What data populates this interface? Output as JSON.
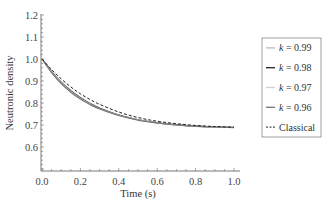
{
  "chart_data": {
    "type": "line",
    "title": "",
    "xlabel": "Time (s)",
    "ylabel": "Neutronic density",
    "xlim": [
      0.0,
      1.0
    ],
    "ylim": [
      0.49,
      1.2
    ],
    "xticks": [
      "0.0",
      "0.2",
      "0.4",
      "0.6",
      "0.8",
      "1.0"
    ],
    "yticks": [
      "0.6",
      "0.7",
      "0.8",
      "0.9",
      "1.0",
      "1.1",
      "1.2"
    ],
    "grid": false,
    "legend_position": "right-outside",
    "x": [
      0.0,
      0.05,
      0.1,
      0.15,
      0.2,
      0.25,
      0.3,
      0.4,
      0.5,
      0.6,
      0.7,
      0.8,
      0.9,
      1.0
    ],
    "series": [
      {
        "name": "k = 0.99",
        "label_k": "k",
        "label_val": " = 0.99",
        "color": "#bbbbbb",
        "width": 1.2,
        "dash": "",
        "values": [
          1.0,
          0.944,
          0.897,
          0.858,
          0.826,
          0.8,
          0.778,
          0.746,
          0.725,
          0.711,
          0.702,
          0.696,
          0.692,
          0.689
        ]
      },
      {
        "name": "k = 0.98",
        "label_k": "k",
        "label_val": " = 0.98",
        "color": "#222222",
        "width": 1.2,
        "dash": "",
        "values": [
          1.0,
          0.942,
          0.894,
          0.855,
          0.823,
          0.797,
          0.776,
          0.745,
          0.724,
          0.71,
          0.701,
          0.695,
          0.691,
          0.689
        ]
      },
      {
        "name": "k = 0.97",
        "label_k": "k",
        "label_val": " = 0.97",
        "color": "#cfcfcf",
        "width": 1.2,
        "dash": "",
        "values": [
          1.0,
          0.94,
          0.891,
          0.852,
          0.82,
          0.795,
          0.774,
          0.744,
          0.723,
          0.709,
          0.7,
          0.695,
          0.691,
          0.689
        ]
      },
      {
        "name": "k = 0.96",
        "label_k": "k",
        "label_val": " = 0.96",
        "color": "#777777",
        "width": 1.2,
        "dash": "",
        "values": [
          1.0,
          0.938,
          0.888,
          0.849,
          0.818,
          0.793,
          0.773,
          0.743,
          0.722,
          0.709,
          0.7,
          0.694,
          0.691,
          0.688
        ]
      },
      {
        "name": "Classical",
        "label_k": "",
        "label_val": "Classical",
        "color": "#222222",
        "width": 1.0,
        "dash": "3,2",
        "values": [
          1.0,
          0.952,
          0.91,
          0.873,
          0.842,
          0.816,
          0.794,
          0.759,
          0.734,
          0.717,
          0.706,
          0.698,
          0.693,
          0.69
        ]
      }
    ]
  }
}
